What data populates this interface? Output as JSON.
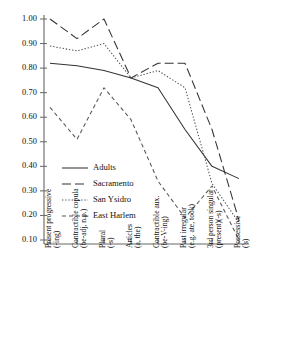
{
  "chart_data": {
    "type": "line",
    "title": "",
    "subtitle": "",
    "xlabel": "",
    "ylabel": "",
    "ylim": [
      0.05,
      1.0
    ],
    "grid": false,
    "legend_position": "lower-left-inside",
    "ytick_labels": [
      "1.00",
      "0.90",
      "0.80",
      "0.70",
      "0.60",
      "0.50",
      "0.40",
      "0.30",
      "0.20",
      "0.10"
    ],
    "ytick_values": [
      1.0,
      0.9,
      0.8,
      0.7,
      0.6,
      0.5,
      0.4,
      0.3,
      0.2,
      0.1
    ],
    "categories": [
      "Present progressive (-ing)",
      "Contractible copula (be-adj, n.p.)",
      "Plural (-s)",
      "Articles (a, the)",
      "Contractible aux. (be-V-ing)",
      "Past irregular (e.g. ate, took)",
      "3rd person singular (present)(-s)",
      "Possessive ('s)"
    ],
    "categories_lines": [
      [
        "Present progressive",
        "(-ing)"
      ],
      [
        "Contractible copula",
        "(be-adj, n.p.)"
      ],
      [
        "Plural",
        "(-s)"
      ],
      [
        "Articles",
        "(a, the)"
      ],
      [
        "Contractible aux.",
        "(be-V-ing)"
      ],
      [
        "Past irregular",
        "(e.g. ate, took)"
      ],
      [
        "3rd person singular",
        "(present)(-s)"
      ],
      [
        "Possessive",
        "('s)"
      ]
    ],
    "series": [
      {
        "name": "Adults",
        "style": "solid",
        "dash": "none",
        "color": "#333333",
        "values": [
          0.82,
          0.81,
          0.79,
          0.76,
          0.72,
          0.55,
          0.4,
          0.35
        ]
      },
      {
        "name": "Sacramento",
        "style": "long-dash",
        "dash": "9,4",
        "color": "#333333",
        "values": [
          1.0,
          0.92,
          1.0,
          0.76,
          0.82,
          0.82,
          0.55,
          0.18
        ]
      },
      {
        "name": "San Ysidro",
        "style": "dotted",
        "dash": "1.4,1.8",
        "color": "#555555",
        "values": [
          0.89,
          0.87,
          0.9,
          0.76,
          0.79,
          0.72,
          0.33,
          0.17
        ]
      },
      {
        "name": "East Harlem",
        "style": "short-dash",
        "dash": "4,3",
        "color": "#555555",
        "values": [
          0.64,
          0.51,
          0.72,
          0.59,
          0.34,
          0.19,
          0.32,
          0.1
        ]
      }
    ]
  },
  "legend": {
    "items": [
      {
        "label": "Adults"
      },
      {
        "label": "Sacramento"
      },
      {
        "label": "San Ysidro"
      },
      {
        "label": "East Harlem"
      }
    ]
  }
}
